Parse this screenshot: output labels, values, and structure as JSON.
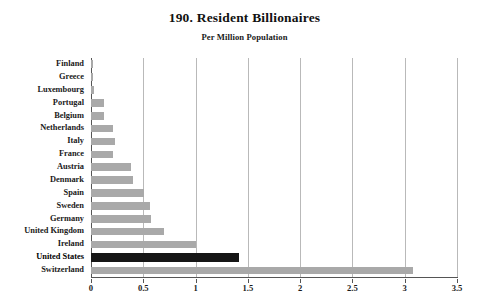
{
  "chart_data": {
    "type": "bar",
    "orientation": "horizontal",
    "title": "190. Resident Billionaires",
    "subtitle": "Per Million Population",
    "xlabel": "",
    "ylabel": "",
    "xlim": [
      0,
      3.5
    ],
    "grid": true,
    "legend": "none",
    "xticks": [
      "0",
      "0.5",
      "1",
      "1.5",
      "2",
      "2.5",
      "3",
      "3.5"
    ],
    "xtick_values": [
      0,
      0.5,
      1,
      1.5,
      2,
      2.5,
      3,
      3.5
    ],
    "categories": [
      "Finland",
      "Greece",
      "Luxembourg",
      "Portugal",
      "Belgium",
      "Netherlands",
      "Italy",
      "France",
      "Austria",
      "Denmark",
      "Spain",
      "Sweden",
      "Germany",
      "United Kingdom",
      "Ireland",
      "United States",
      "Switzerland"
    ],
    "values": [
      0.02,
      0.02,
      0.03,
      0.12,
      0.12,
      0.21,
      0.23,
      0.21,
      0.38,
      0.4,
      0.51,
      0.56,
      0.57,
      0.7,
      1.0,
      1.42,
      3.08
    ],
    "highlight_category": "United States",
    "colors": {
      "bar": "#a9a9a9",
      "bar_highlight": "#151515",
      "grid": "#b9b9b9",
      "axis": "#555555",
      "text": "#1a1a1a",
      "background": "#ffffff"
    }
  }
}
